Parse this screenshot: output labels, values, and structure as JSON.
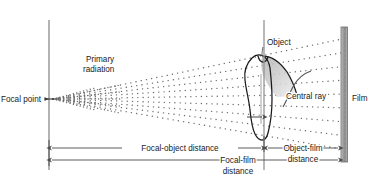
{
  "diagram": {
    "background_color": "#ffffff",
    "labels": {
      "focal_point": "Focal point",
      "primary_radiation_line1": "Primary",
      "primary_radiation_line2": "radiation",
      "object": "Object",
      "central_ray": "Central ray",
      "film": "Film",
      "focal_object_distance": "Focal-object distance",
      "focal_film_distance_line1": "Focal-film",
      "focal_film_distance_line2": "distance",
      "object_film_distance_line1": "Object-film",
      "object_film_distance_line2": "distance"
    },
    "colors": {
      "ink": "#1a1a1a",
      "line": "#555555",
      "dim_line": "#4a4a4a",
      "film_fill": "#a8a8a8",
      "film_stroke": "#6a6a6a",
      "radiation_dot": "#6d6d6d",
      "crown_shade": "#c9c9c9",
      "background": "#ffffff"
    },
    "geometry": {
      "focal_point_x": 49,
      "focal_point_y": 99,
      "source_axis_x": 49,
      "source_axis_top_y": 20,
      "source_axis_bottom_y": 170,
      "object_axis_x": 264,
      "film_x": 347,
      "film_top_y": 27,
      "film_bottom_y": 162,
      "cone_top_at_film_y": 38,
      "cone_bottom_at_film_y": 150,
      "beam_ray_count": 9,
      "dim_row_focal_object_y": 148,
      "dim_row_focal_film_y": 160,
      "dim_row_object_film_y": 148
    }
  }
}
